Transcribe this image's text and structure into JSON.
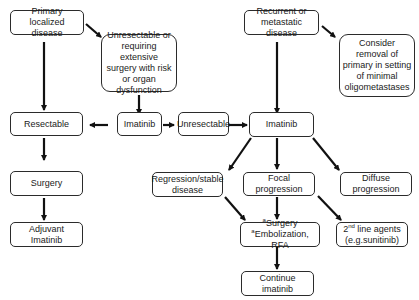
{
  "diagram": {
    "nodes": {
      "primary_localized": "Primary localized disease",
      "unresectable_extensive": "Unresectable or requiring extensive surgery with risk or organ dysfunction",
      "resectable": "Resectable",
      "imatinib_left": "Imatinib",
      "unresectable": "Unresectable",
      "surgery": "Surgery",
      "adjuvant_imatinib": "Adjuvant Imatinib",
      "recurrent_metastatic": "Recurrent or metastatic disease",
      "consider_removal": "Consider removal of primary in setting of minimal oligometastases",
      "imatinib_right": "Imatinib",
      "regression_stable": "Regression/stable disease",
      "focal_progression": "Focal progression",
      "diffuse_progression": "Diffuse progression",
      "surgery_option_line1": "Surgery",
      "surgery_option_line2": "Embolization, RFA",
      "surgery_option_marker": "a",
      "second_line_prefix": "2",
      "second_line_sup": "nd",
      "second_line_rest": " line agents",
      "second_line_example": "(e.g.sunitinib)",
      "continue_imatinib": "Continue imatinib"
    },
    "edges": [
      [
        "primary_localized",
        "resectable"
      ],
      [
        "primary_localized",
        "unresectable_extensive"
      ],
      [
        "unresectable_extensive",
        "imatinib_left"
      ],
      [
        "imatinib_left",
        "resectable"
      ],
      [
        "imatinib_left",
        "unresectable"
      ],
      [
        "unresectable",
        "imatinib_right"
      ],
      [
        "resectable",
        "surgery"
      ],
      [
        "surgery",
        "adjuvant_imatinib"
      ],
      [
        "recurrent_metastatic",
        "imatinib_right"
      ],
      [
        "recurrent_metastatic",
        "consider_removal"
      ],
      [
        "imatinib_right",
        "regression_stable"
      ],
      [
        "imatinib_right",
        "focal_progression"
      ],
      [
        "imatinib_right",
        "diffuse_progression"
      ],
      [
        "regression_stable",
        "surgery_option"
      ],
      [
        "focal_progression",
        "surgery_option"
      ],
      [
        "focal_progression",
        "second_line_agents"
      ],
      [
        "surgery_option",
        "continue_imatinib"
      ]
    ]
  }
}
